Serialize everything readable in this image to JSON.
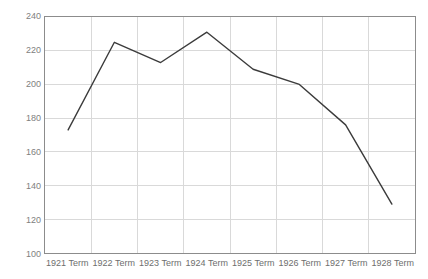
{
  "chart_data": {
    "type": "line",
    "title": "",
    "xlabel": "",
    "ylabel": "",
    "categories": [
      "1921 Term",
      "1922 Term",
      "1923 Term",
      "1924 Term",
      "1925 Term",
      "1926 Term",
      "1927 Term",
      "1928 Term"
    ],
    "values": [
      173,
      225,
      213,
      231,
      209,
      200,
      176,
      129
    ],
    "series": [
      {
        "name": "",
        "values": [
          173,
          225,
          213,
          231,
          209,
          200,
          176,
          129
        ]
      }
    ],
    "ylim": [
      100,
      240
    ],
    "yticks": [
      100,
      120,
      140,
      160,
      180,
      200,
      220,
      240
    ],
    "ytick_labels": [
      "100",
      "120",
      "140",
      "160",
      "180",
      "200",
      "220",
      "240"
    ],
    "grid": true,
    "legend": "none",
    "line_color": "#3b3b3b",
    "grid_color": "#d9d9d9",
    "axis_color": "#8c8c8c",
    "background_color": "#ffffff",
    "tick_label_color": "#6e6e6e"
  }
}
